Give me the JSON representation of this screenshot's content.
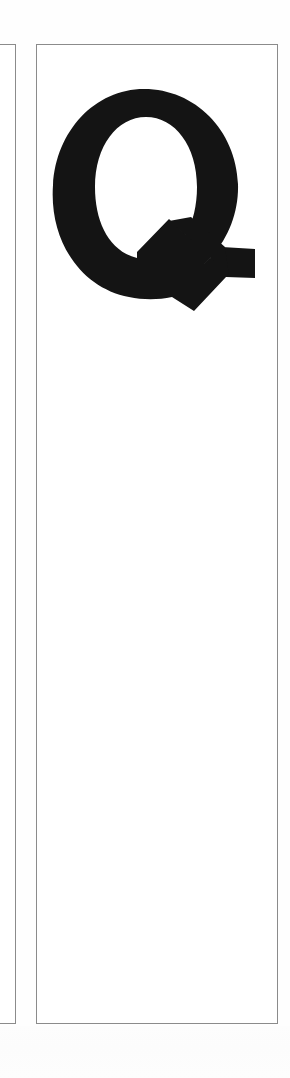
{
  "page": {
    "kind": "scanned-book-page-fragment",
    "background_color": "#ffffff",
    "width_px": 290,
    "height_px": 1078
  },
  "frames": {
    "left_partial": {
      "name": "partial-column-frame",
      "border_color": "#8b8b8b",
      "border_width_px": 1,
      "clipped": "left edge cropped by page boundary"
    },
    "main": {
      "name": "column-frame",
      "border_color": "#8b8b8b",
      "border_width_px": 1
    }
  },
  "content": {
    "initial_capital": {
      "character": "Q",
      "style": "bold serif drop cap",
      "color": "#141414",
      "alt_text": "Q"
    },
    "body_text": ""
  }
}
